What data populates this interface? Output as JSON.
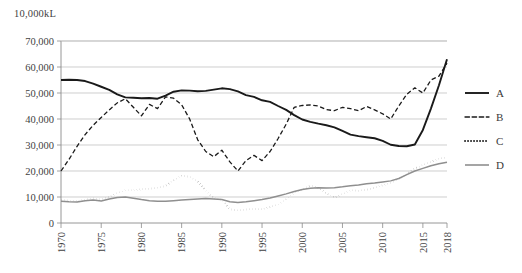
{
  "axis_unit_label": "10,000kL",
  "legend": {
    "items": [
      {
        "name": "A",
        "style": "solid",
        "color": "#1a1a1a",
        "width": 1.9
      },
      {
        "name": "B",
        "style": "dashed",
        "color": "#1a1a1a",
        "width": 1.3
      },
      {
        "name": "C",
        "style": "dotted",
        "color": "#1a1a1a",
        "width": 1.8
      },
      {
        "name": "D",
        "style": "solid",
        "color": "#8f8f8f",
        "width": 1.6
      }
    ]
  },
  "chart_data": {
    "type": "line",
    "title": "",
    "xlabel": "",
    "ylabel": "10,000kL",
    "ylim": [
      0,
      70000
    ],
    "ytick_step": 10000,
    "ytick_labels": [
      "0",
      "10,000",
      "20,000",
      "30,000",
      "40,000",
      "50,000",
      "60,000",
      "70,000"
    ],
    "ytick_values": [
      0,
      10000,
      20000,
      30000,
      40000,
      50000,
      60000,
      70000
    ],
    "xlim": [
      1970,
      2018
    ],
    "xtick_labels": [
      "1970",
      "1975",
      "1980",
      "1985",
      "1990",
      "1995",
      "2000",
      "2005",
      "2010",
      "2015",
      "2018"
    ],
    "xtick_values": [
      1970,
      1975,
      1980,
      1985,
      1990,
      1995,
      2000,
      2005,
      2010,
      2015,
      2018
    ],
    "grid": true,
    "legend_position": "right",
    "x": [
      1970,
      1971,
      1972,
      1973,
      1974,
      1975,
      1976,
      1977,
      1978,
      1979,
      1980,
      1981,
      1982,
      1983,
      1984,
      1985,
      1986,
      1987,
      1988,
      1989,
      1990,
      1991,
      1992,
      1993,
      1994,
      1995,
      1996,
      1997,
      1998,
      1999,
      2000,
      2001,
      2002,
      2003,
      2004,
      2005,
      2006,
      2007,
      2008,
      2009,
      2010,
      2011,
      2012,
      2013,
      2014,
      2015,
      2016,
      2017,
      2018
    ],
    "series": [
      {
        "name": "A",
        "style": "solid",
        "color": "#1a1a1a",
        "values": [
          55000,
          55100,
          55000,
          54600,
          53600,
          52400,
          51200,
          49500,
          48300,
          48200,
          48000,
          48100,
          47800,
          49000,
          50500,
          51000,
          50900,
          50700,
          50800,
          51300,
          51800,
          51500,
          50600,
          49200,
          48500,
          47200,
          46600,
          45000,
          43500,
          41500,
          39800,
          38900,
          38200,
          37600,
          36800,
          35400,
          34000,
          33400,
          33000,
          32600,
          31600,
          30100,
          29600,
          29500,
          30200,
          35800,
          44000,
          53000,
          63000
        ]
      },
      {
        "name": "B",
        "style": "dashed",
        "color": "#1a1a1a",
        "values": [
          20000,
          24500,
          29500,
          34000,
          37600,
          40600,
          43500,
          46200,
          47800,
          44500,
          41200,
          45600,
          44000,
          48500,
          48000,
          45500,
          40000,
          32000,
          27500,
          25500,
          28000,
          23500,
          20000,
          24000,
          26000,
          24000,
          27500,
          32500,
          38000,
          44500,
          45200,
          45400,
          45000,
          43600,
          43200,
          44500,
          44000,
          43200,
          44800,
          43500,
          42000,
          40000,
          45000,
          49500,
          52000,
          50000,
          55000,
          56500,
          61500
        ]
      },
      {
        "name": "C",
        "style": "dotted",
        "color": "#1a1a1a",
        "values": [
          8800,
          8600,
          8500,
          9000,
          9500,
          9100,
          10000,
          11500,
          12600,
          12500,
          13000,
          13200,
          13500,
          14200,
          16500,
          18200,
          17800,
          16000,
          12500,
          9500,
          9000,
          5300,
          4800,
          5200,
          5400,
          5300,
          6200,
          7000,
          9200,
          11500,
          13000,
          14300,
          13500,
          11500,
          9800,
          11200,
          12600,
          12400,
          12800,
          13600,
          14500,
          15500,
          16800,
          18800,
          21000,
          22300,
          23500,
          24800,
          25200
        ]
      },
      {
        "name": "D",
        "style": "solid",
        "color": "#8f8f8f",
        "values": [
          8400,
          8200,
          8100,
          8600,
          8800,
          8500,
          9200,
          9800,
          10000,
          9500,
          9000,
          8600,
          8400,
          8400,
          8600,
          8800,
          9000,
          9200,
          9400,
          9200,
          9000,
          8200,
          7900,
          8200,
          8600,
          9000,
          9600,
          10400,
          11200,
          12100,
          12900,
          13400,
          13600,
          13500,
          13600,
          13900,
          14300,
          14600,
          15100,
          15400,
          15800,
          16200,
          17100,
          18600,
          20000,
          21000,
          22000,
          22800,
          23400
        ]
      }
    ]
  }
}
